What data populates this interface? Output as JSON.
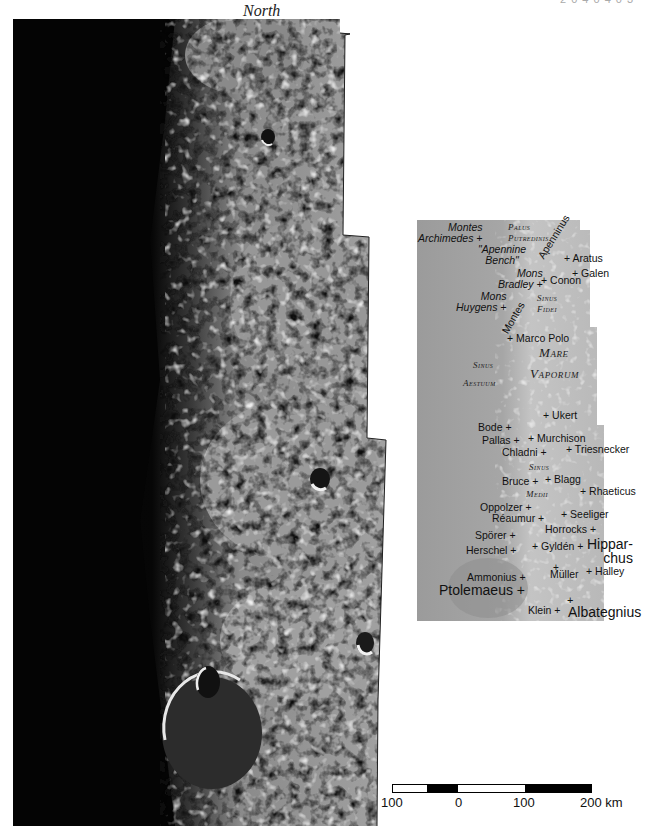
{
  "header": {
    "orientation_label": "North",
    "corner_code": "2 0 4 0 4 0 3"
  },
  "main_photo": {
    "description": "Lunar terminator mosaic, dark limb to left, lit highlands and maria to right",
    "colors": {
      "night": "#050505",
      "mare": "#8c8c8c",
      "highland": "#b5b5b5",
      "shadow": "#1a1a1a"
    }
  },
  "inset": {
    "background": "#a8a8a8",
    "labels": [
      {
        "id": "montes-archimedes",
        "text": "Montes\nArchimedes +",
        "style": "italic",
        "x": 422,
        "y": 221
      },
      {
        "id": "palus-putredinis",
        "text": "Palus\nPutredinis",
        "style": "smallcaps",
        "x": 497,
        "y": 222
      },
      {
        "id": "apennine-bench",
        "text": "\"Apennine\nBench\"",
        "style": "italic",
        "x": 476,
        "y": 246
      },
      {
        "id": "montes-apenninus",
        "text": "Apenninus",
        "style": "rotated",
        "x": 536,
        "y": 262
      },
      {
        "id": "aratus",
        "text": "+ Aratus",
        "style": "normal",
        "x": 564,
        "y": 254
      },
      {
        "id": "galen",
        "text": "+ Galen",
        "style": "normal",
        "x": 572,
        "y": 268
      },
      {
        "id": "mons-bradley",
        "text": "Mons\nBradley +",
        "style": "italic",
        "x": 499,
        "y": 268
      },
      {
        "id": "conon",
        "text": "+ Conon",
        "style": "normal",
        "x": 541,
        "y": 276
      },
      {
        "id": "mons-huygens",
        "text": "Mons\nHuygens +",
        "style": "italic",
        "x": 456,
        "y": 291
      },
      {
        "id": "montes",
        "text": "Montes",
        "style": "rotated",
        "x": 500,
        "y": 322
      },
      {
        "id": "sinus-fidei",
        "text": "Sinus\nFidei",
        "style": "smallcaps",
        "x": 533,
        "y": 293
      },
      {
        "id": "marco-polo",
        "text": "+ Marco Polo",
        "style": "normal",
        "x": 507,
        "y": 333
      },
      {
        "id": "mare",
        "text": "Mare",
        "style": "smallcaps-big",
        "x": 538,
        "y": 348
      },
      {
        "id": "vaporum",
        "text": "Vaporum",
        "style": "smallcaps-big",
        "x": 530,
        "y": 369
      },
      {
        "id": "sinus-aestuum-1",
        "text": "Sinus",
        "style": "smallcaps",
        "x": 471,
        "y": 360
      },
      {
        "id": "sinus-aestuum-2",
        "text": "Aestuum",
        "style": "smallcaps",
        "x": 463,
        "y": 377
      },
      {
        "id": "ukert",
        "text": "+ Ukert",
        "style": "normal",
        "x": 543,
        "y": 410
      },
      {
        "id": "bode",
        "text": "Bode +",
        "style": "normal",
        "x": 478,
        "y": 422
      },
      {
        "id": "pallas",
        "text": "Pallas +",
        "style": "normal",
        "x": 482,
        "y": 435
      },
      {
        "id": "murchison",
        "text": "+ Murchison",
        "style": "normal",
        "x": 528,
        "y": 433
      },
      {
        "id": "chladni",
        "text": "Chladni +",
        "style": "normal",
        "x": 502,
        "y": 447
      },
      {
        "id": "triesnecker",
        "text": "+ Triesnecker",
        "style": "normal",
        "x": 568,
        "y": 445
      },
      {
        "id": "sinus-medii-1",
        "text": "Sinus",
        "style": "smallcaps",
        "x": 529,
        "y": 462
      },
      {
        "id": "bruce",
        "text": "Bruce +",
        "style": "normal",
        "x": 502,
        "y": 476
      },
      {
        "id": "blagg",
        "text": "+ Blagg",
        "style": "normal",
        "x": 545,
        "y": 474
      },
      {
        "id": "sinus-medii-2",
        "text": "Medii",
        "style": "smallcaps",
        "x": 526,
        "y": 489
      },
      {
        "id": "rhaeticus",
        "text": "+ Rhaeticus",
        "style": "normal",
        "x": 580,
        "y": 486
      },
      {
        "id": "oppolzer",
        "text": "Oppolzer +",
        "style": "normal",
        "x": 480,
        "y": 503
      },
      {
        "id": "reaumur",
        "text": "Réaumur +",
        "style": "normal",
        "x": 492,
        "y": 514
      },
      {
        "id": "seeliger",
        "text": "+ Seeliger",
        "style": "normal",
        "x": 561,
        "y": 510
      },
      {
        "id": "horrocks",
        "text": "Horrocks +",
        "style": "normal",
        "x": 545,
        "y": 525
      },
      {
        "id": "sporer",
        "text": "Spörer +",
        "style": "normal",
        "x": 475,
        "y": 531
      },
      {
        "id": "hipparchus",
        "text": "Hippar-\nchus",
        "style": "big",
        "x": 587,
        "y": 538
      },
      {
        "id": "gylden",
        "text": "+ Gyldén +",
        "style": "normal",
        "x": 532,
        "y": 542
      },
      {
        "id": "herschel",
        "text": "Herschel +",
        "style": "normal",
        "x": 466,
        "y": 545
      },
      {
        "id": "muller",
        "text": "Müller",
        "style": "normal",
        "x": 550,
        "y": 570
      },
      {
        "id": "halley",
        "text": "+ Halley",
        "style": "normal",
        "x": 586,
        "y": 567
      },
      {
        "id": "ammonius",
        "text": "Ammonius +",
        "style": "normal",
        "x": 466,
        "y": 572
      },
      {
        "id": "ptolemaeus",
        "text": "Ptolemaeus +",
        "style": "big",
        "x": 439,
        "y": 583
      },
      {
        "id": "klein",
        "text": "Klein +",
        "style": "normal",
        "x": 528,
        "y": 604
      },
      {
        "id": "albategnius",
        "text": "Albategnius",
        "style": "big",
        "x": 568,
        "y": 606
      }
    ]
  },
  "scale_bar": {
    "unit": "km",
    "ticks": [
      "100",
      "0",
      "100",
      "200 km"
    ],
    "segments": [
      "white",
      "black",
      "white",
      "black"
    ]
  }
}
